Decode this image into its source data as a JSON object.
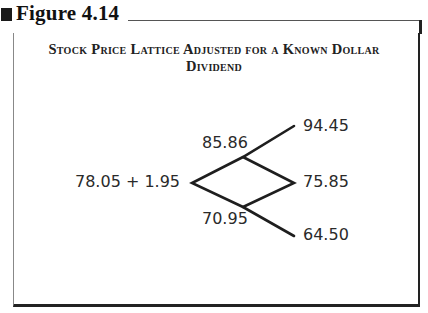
{
  "figure": {
    "label": "Figure 4.14",
    "title": "Stock Price Lattice Adjusted for a Known Dollar Dividend"
  },
  "lattice": {
    "root": "78.05 + 1.95",
    "up": "85.86",
    "down": "70.95",
    "up_up": "94.45",
    "up_down": "75.85",
    "down_down": "64.50"
  }
}
